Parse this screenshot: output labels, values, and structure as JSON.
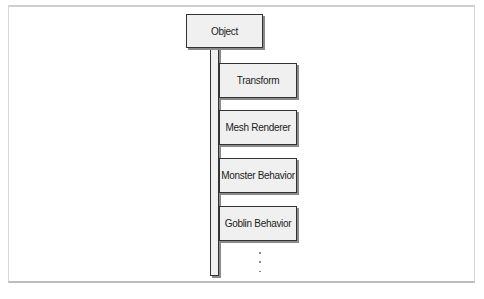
{
  "diagram": {
    "root": {
      "label": "Object"
    },
    "components": [
      {
        "label": "Transform"
      },
      {
        "label": "Mesh Renderer"
      },
      {
        "label": "Monster Behavior"
      },
      {
        "label": "Goblin Behavior"
      }
    ],
    "continuation": "⋮",
    "colors": {
      "box_fill": "#f0f0f0",
      "box_border": "#333333",
      "shadow": "#8a8a8a",
      "frame": "#cfcfcf"
    }
  }
}
